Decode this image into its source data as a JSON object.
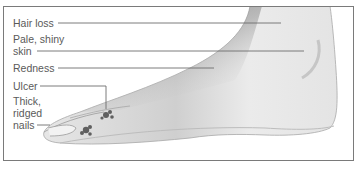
{
  "figure": {
    "labels": [
      {
        "id": "hair-loss",
        "text": "Hair loss"
      },
      {
        "id": "pale-shiny-skin",
        "line1": "Pale, shiny",
        "line2": "skin"
      },
      {
        "id": "redness",
        "text": "Redness"
      },
      {
        "id": "ulcer",
        "text": "Ulcer"
      },
      {
        "id": "thick-ridged-nails",
        "line1": "Thick,",
        "line2": "ridged",
        "line3": "nails"
      }
    ]
  },
  "colors": {
    "frame_border": "#7a7a7a",
    "label_text": "#5a5a5a",
    "leader_line": "#6e6e6e",
    "foot_light": "#ececec",
    "foot_shadow": "#8c8c8c",
    "ulcer_mark": "#4a4a4a"
  }
}
